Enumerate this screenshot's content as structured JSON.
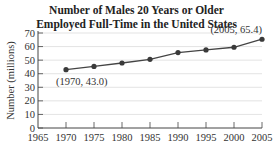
{
  "chart_data": {
    "type": "line",
    "title_lines": [
      "Number of Males 20 Years or Older",
      "Employed Full-Time in the United States"
    ],
    "xlabel": "",
    "ylabel": "Number (millions)",
    "x": [
      1970,
      1975,
      1980,
      1985,
      1990,
      1995,
      2000,
      2005
    ],
    "series": [
      {
        "name": "Males employed full-time",
        "values": [
          43.0,
          45.4,
          47.9,
          50.6,
          55.6,
          57.5,
          59.5,
          65.4
        ]
      }
    ],
    "x_ticks": [
      "1965",
      "1970",
      "1975",
      "1980",
      "1985",
      "1990",
      "1995",
      "2000",
      "2005"
    ],
    "y_ticks": [
      "0",
      "10",
      "20",
      "30",
      "40",
      "50",
      "60",
      "70"
    ],
    "ylim": [
      0,
      70
    ],
    "xlim": [
      1965,
      2005
    ],
    "grid": true,
    "annotations": [
      "(1970, 43.0)",
      "(2005, 65.4)"
    ],
    "line_color": "#444444",
    "caption": "Figure 2.xx"
  }
}
